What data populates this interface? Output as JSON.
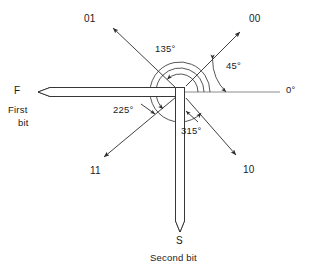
{
  "figure": {
    "center": {
      "x": 180,
      "y": 92
    },
    "reference_angle_label": "0°"
  },
  "bits": {
    "first": {
      "letter": "F",
      "name_line1": "First",
      "name_line2": "bit",
      "direction": "left",
      "tip_x": 38,
      "tail_x": 180,
      "y": 92,
      "thickness": 9
    },
    "second": {
      "letter": "S",
      "name": "Second bit",
      "direction": "down",
      "tip_y": 232,
      "tail_y": 92,
      "x": 180,
      "thickness": 9
    }
  },
  "rays": [
    {
      "label": "00",
      "angle_deg": 45,
      "label_x": 249,
      "label_y": 13,
      "tip_x": 240,
      "tip_y": 32,
      "tail_x": 186,
      "tail_y": 86
    },
    {
      "label": "01",
      "angle_deg": 135,
      "label_x": 84,
      "label_y": 13,
      "tip_x": 113,
      "tip_y": 28,
      "tail_x": 174,
      "tail_y": 86
    },
    {
      "label": "11",
      "angle_deg": 225,
      "label_x": 90,
      "label_y": 165,
      "tip_x": 104,
      "tip_y": 157,
      "tail_x": 174,
      "tail_y": 98
    },
    {
      "label": "10",
      "angle_deg": 315,
      "label_x": 243,
      "label_y": 164,
      "tip_x": 236,
      "tip_y": 155,
      "tail_x": 186,
      "tail_y": 98
    }
  ],
  "reference": {
    "label": "0°",
    "label_x": 286,
    "label_y": 84,
    "from_x": 182,
    "to_x": 280,
    "y": 92
  },
  "angle_marks": [
    {
      "label": "135°",
      "value": 135,
      "label_x": 155,
      "label_y": 43,
      "radius": 18
    },
    {
      "label": "225°",
      "value": 225,
      "label_x": 113,
      "label_y": 104,
      "radius": 24
    },
    {
      "label": "315°",
      "value": 315,
      "label_x": 181,
      "label_y": 125,
      "radius": 30
    },
    {
      "label": "45°",
      "value": 45,
      "label_x": 226,
      "label_y": 60,
      "radius": 46
    }
  ],
  "colors": {
    "ink": "#2b2b2b",
    "reference_line": "#6e6e6e",
    "background": "#ffffff",
    "hatch": "#3a3a3a"
  }
}
